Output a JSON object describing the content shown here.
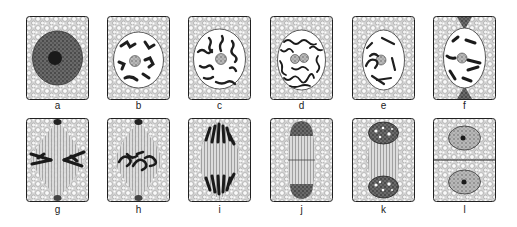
{
  "figure": {
    "colors": {
      "ink": "#1e1e1e",
      "cytoplasm": "#e8e8e8",
      "background": "#ffffff"
    },
    "panels": [
      {
        "label": "a",
        "stage": "interphase"
      },
      {
        "label": "b",
        "stage": "early-prophase"
      },
      {
        "label": "c",
        "stage": "prophase"
      },
      {
        "label": "d",
        "stage": "prophase-spireme"
      },
      {
        "label": "e",
        "stage": "late-prophase"
      },
      {
        "label": "f",
        "stage": "prometaphase"
      },
      {
        "label": "g",
        "stage": "metaphase"
      },
      {
        "label": "h",
        "stage": "metaphase-late"
      },
      {
        "label": "i",
        "stage": "anaphase"
      },
      {
        "label": "j",
        "stage": "late-anaphase"
      },
      {
        "label": "k",
        "stage": "telophase"
      },
      {
        "label": "l",
        "stage": "cytokinesis"
      }
    ]
  }
}
